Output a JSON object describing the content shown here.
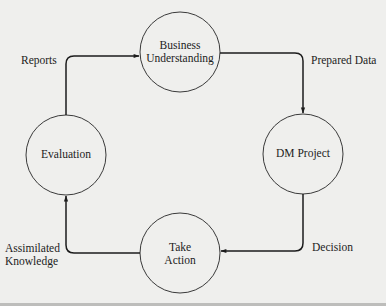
{
  "diagram": {
    "type": "cycle",
    "colors": {
      "background": "#efefed",
      "stroke": "#2a2a2a",
      "text": "#1c1c1c"
    },
    "nodes": [
      {
        "id": "business",
        "label_line1": "Business",
        "label_line2": "Understanding"
      },
      {
        "id": "dm_project",
        "label_line1": "DM Project"
      },
      {
        "id": "take_action",
        "label_line1": "Take",
        "label_line2": "Action"
      },
      {
        "id": "evaluation",
        "label_line1": "Evaluation"
      }
    ],
    "edges": [
      {
        "from": "business",
        "to": "dm_project",
        "label": "Prepared Data"
      },
      {
        "from": "dm_project",
        "to": "take_action",
        "label": "Decision"
      },
      {
        "from": "take_action",
        "to": "evaluation",
        "label_line1": "Assimilated",
        "label_line2": "Knowledge"
      },
      {
        "from": "evaluation",
        "to": "business",
        "label": "Reports"
      }
    ]
  }
}
